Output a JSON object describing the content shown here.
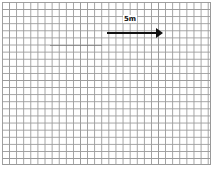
{
  "diagram": {
    "type": "grid-with-arrow",
    "grid": {
      "cell_size_px": 7,
      "line_color": "#9a9a9a",
      "background": "#ffffff"
    },
    "arrow": {
      "label": "5m",
      "direction": "right",
      "color": "#111111"
    }
  }
}
